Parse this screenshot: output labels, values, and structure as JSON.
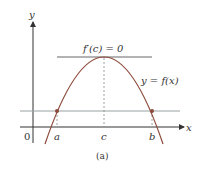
{
  "diagram": {
    "axis_labels": {
      "y": "y",
      "x": "x",
      "origin": "0"
    },
    "tangent_label": "f′(c) = 0",
    "curve_label": "y = f(x)",
    "points": {
      "a": "a",
      "c": "c",
      "b": "b"
    },
    "caption": "(a)",
    "colors": {
      "curve": "#8b4a3a",
      "axis": "#333333",
      "horizontal_line": "#9aa0a0",
      "tangent": "#666666",
      "dot": "#8b4a3a"
    }
  }
}
